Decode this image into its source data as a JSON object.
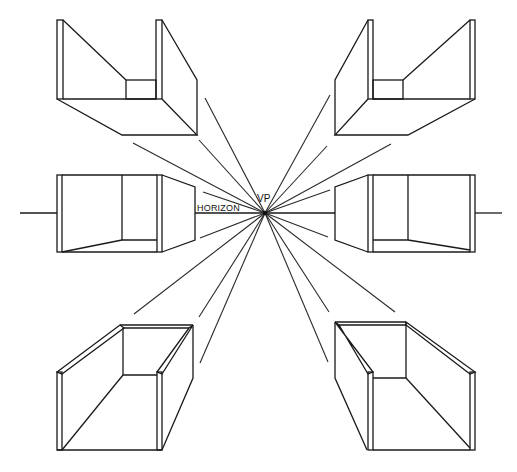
{
  "figure": {
    "labels": {
      "horizon": "HORIZON",
      "vanishing_point": "VP"
    },
    "vanishing_point": {
      "x": 265,
      "y": 213
    },
    "horizon_y": 213,
    "boxes": [
      {
        "id": "top-left",
        "position": "above-left of VP"
      },
      {
        "id": "top-right",
        "position": "above-right of VP"
      },
      {
        "id": "middle-left",
        "position": "on horizon, left of VP"
      },
      {
        "id": "middle-right",
        "position": "on horizon, right of VP"
      },
      {
        "id": "bottom-left",
        "position": "below-left of VP"
      },
      {
        "id": "bottom-right",
        "position": "below-right of VP"
      }
    ],
    "colors": {
      "line": "#1a1a1a",
      "background": "#ffffff"
    }
  }
}
